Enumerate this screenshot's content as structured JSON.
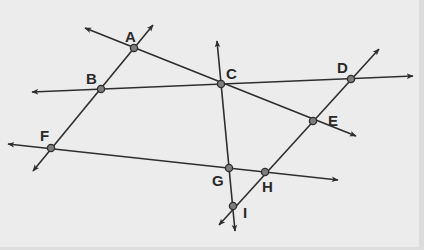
{
  "diagram": {
    "title": "",
    "background": "#ececec",
    "line_color": "#2e2e2e",
    "point_fill": "#7d7d7d",
    "points": [
      {
        "id": "A",
        "label": "A",
        "x": 134,
        "y": 48,
        "lx": 125,
        "ly": 42
      },
      {
        "id": "B",
        "label": "B",
        "x": 101,
        "y": 89,
        "lx": 86,
        "ly": 84
      },
      {
        "id": "C",
        "label": "C",
        "x": 221,
        "y": 84,
        "lx": 226,
        "ly": 79
      },
      {
        "id": "D",
        "label": "D",
        "x": 351,
        "y": 79,
        "lx": 337,
        "ly": 73
      },
      {
        "id": "E",
        "label": "E",
        "x": 313,
        "y": 121,
        "lx": 328,
        "ly": 126
      },
      {
        "id": "F",
        "label": "F",
        "x": 51,
        "y": 148,
        "lx": 40,
        "ly": 141
      },
      {
        "id": "G",
        "label": "G",
        "x": 229,
        "y": 168,
        "lx": 212,
        "ly": 186
      },
      {
        "id": "H",
        "label": "H",
        "x": 265,
        "y": 172,
        "lx": 262,
        "ly": 192
      },
      {
        "id": "I",
        "label": "I",
        "x": 233,
        "y": 206,
        "lx": 243,
        "ly": 218
      }
    ],
    "lines": [
      {
        "id": "line-FBA",
        "through": [
          "F",
          "B",
          "A"
        ],
        "x1": 33,
        "y1": 171,
        "x2": 153,
        "y2": 25
      },
      {
        "id": "line-ACE",
        "through": [
          "A",
          "C",
          "E"
        ],
        "x1": 85,
        "y1": 28,
        "x2": 356,
        "y2": 136
      },
      {
        "id": "line-BCD",
        "through": [
          "B",
          "C",
          "D"
        ],
        "x1": 32,
        "y1": 92,
        "x2": 413,
        "y2": 76
      },
      {
        "id": "line-CGI",
        "through": [
          "C",
          "G",
          "I"
        ],
        "x1": 217,
        "y1": 41,
        "x2": 235,
        "y2": 231
      },
      {
        "id": "line-FGH",
        "through": [
          "F",
          "G",
          "H"
        ],
        "x1": 8,
        "y1": 144,
        "x2": 338,
        "y2": 180
      },
      {
        "id": "line-IHED",
        "through": [
          "I",
          "H",
          "E",
          "D"
        ],
        "x1": 219,
        "y1": 225,
        "x2": 379,
        "y2": 49
      }
    ]
  }
}
